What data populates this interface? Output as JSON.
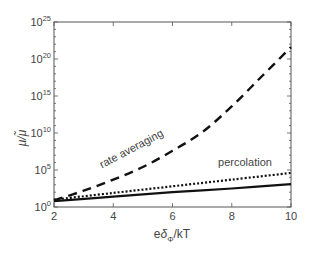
{
  "chart_data": {
    "type": "line",
    "title": "",
    "xlabel": "eδΦ/kT",
    "xlabel_parts": {
      "base": "e",
      "delta": "δ",
      "sub": "Φ",
      "rest": "/kT"
    },
    "ylabel": "μ/μ̃",
    "xlim": [
      2,
      10
    ],
    "ylim_log10": [
      0,
      25
    ],
    "yscale": "log",
    "grid": false,
    "legend": "none (inline annotations)",
    "x_ticks": [
      "2",
      "4",
      "6",
      "8",
      "10"
    ],
    "x_tick_values": [
      2,
      4,
      6,
      8,
      10
    ],
    "y_ticks": [
      {
        "base": "10",
        "exp": "0",
        "value_log10": 0
      },
      {
        "base": "10",
        "exp": "5",
        "value_log10": 5
      },
      {
        "base": "10",
        "exp": "10",
        "value_log10": 10
      },
      {
        "base": "10",
        "exp": "15",
        "value_log10": 15
      },
      {
        "base": "10",
        "exp": "20",
        "value_log10": 20
      },
      {
        "base": "10",
        "exp": "25",
        "value_log10": 25
      }
    ],
    "series": [
      {
        "name": "rate averaging",
        "style": "dashed",
        "x": [
          2,
          3,
          4,
          5,
          6,
          7,
          8,
          9,
          10
        ],
        "log10_y": [
          0.9,
          2.2,
          3.7,
          5.4,
          7.6,
          10.1,
          13.6,
          17.6,
          21.6
        ]
      },
      {
        "name": "percolation",
        "style": "dotted",
        "x": [
          2,
          4,
          6,
          8,
          10
        ],
        "log10_y": [
          1.0,
          1.9,
          2.8,
          3.7,
          4.6
        ]
      },
      {
        "name": "(unlabeled)",
        "style": "solid",
        "x": [
          2,
          4,
          6,
          8,
          10
        ],
        "log10_y": [
          0.8,
          1.4,
          2.0,
          2.5,
          3.1
        ]
      }
    ],
    "annotations": [
      {
        "text": "rate averaging",
        "series": "rate averaging"
      },
      {
        "text": "percolation",
        "series": "percolation"
      }
    ]
  },
  "colors": {
    "axis": "#555555",
    "lines": "#111111",
    "text": "#444444"
  }
}
